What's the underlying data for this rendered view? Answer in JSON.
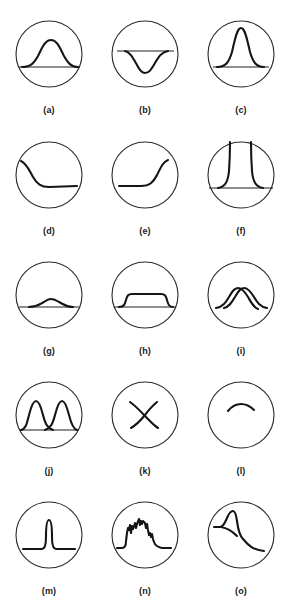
{
  "figure": {
    "type": "grid-of-circular-diagrams",
    "rows": 5,
    "columns": 3,
    "stroke_color": "#151515",
    "background": "#ffffff",
    "panels": [
      {
        "id": "a",
        "label": "(a)",
        "shape": "medium bell curve on baseline"
      },
      {
        "id": "b",
        "label": "(b)",
        "shape": "inverted bell curve below line"
      },
      {
        "id": "c",
        "label": "(c)",
        "shape": "tall narrow bell curve on baseline"
      },
      {
        "id": "d",
        "label": "(d)",
        "shape": "descending sigmoid"
      },
      {
        "id": "e",
        "label": "(e)",
        "shape": "ascending sigmoid"
      },
      {
        "id": "f",
        "label": "(f)",
        "shape": "tall steep flanks off baseline"
      },
      {
        "id": "g",
        "label": "(g)",
        "shape": "small low bump on baseline"
      },
      {
        "id": "h",
        "label": "(h)",
        "shape": "flat-top trapezoid on baseline"
      },
      {
        "id": "i",
        "label": "(i)",
        "shape": "two overlapping bell curves"
      },
      {
        "id": "j",
        "label": "(j)",
        "shape": "two separated peaks on baseline"
      },
      {
        "id": "k",
        "label": "(k)",
        "shape": "crossing lines (X)"
      },
      {
        "id": "l",
        "label": "(l)",
        "shape": "short arc"
      },
      {
        "id": "m",
        "label": "(m)",
        "shape": "narrow spike"
      },
      {
        "id": "n",
        "label": "(n)",
        "shape": "noisy jagged peak"
      },
      {
        "id": "o",
        "label": "(o)",
        "shape": "skewed peak with decaying tail"
      }
    ]
  }
}
